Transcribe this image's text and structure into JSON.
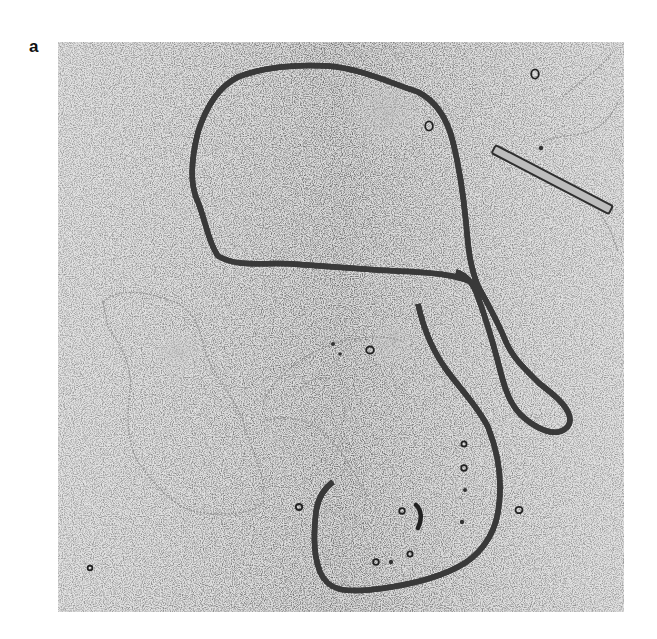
{
  "figure": {
    "panel_label": "a",
    "image_type": "electron micrograph",
    "scale_bar": {
      "present": true,
      "label": ""
    },
    "colors": {
      "background": "#ffffff",
      "micrograph_bg": "#d9d9d9",
      "strand": "#2e2e2e",
      "faint_strand": "#8a8a8a",
      "scale_bar_fill": "#bdbdbd",
      "scale_bar_outline": "#333333"
    }
  }
}
